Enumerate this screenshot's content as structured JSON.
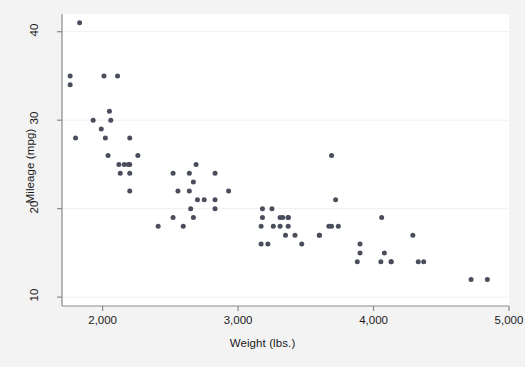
{
  "chart_data": {
    "type": "scatter",
    "title": "",
    "subtitle": "",
    "xlabel": "Weight (lbs.)",
    "ylabel": "Mileage (mpg)",
    "xlim": [
      1700,
      5000
    ],
    "ylim": [
      9,
      42
    ],
    "xticks": [
      2000,
      3000,
      4000,
      5000
    ],
    "xticklabels": [
      "2,000",
      "3,000",
      "4,000",
      "5,000"
    ],
    "yticks": [
      10,
      20,
      30,
      40
    ],
    "yticklabels": [
      "10",
      "20",
      "30",
      "40"
    ],
    "grid": "horizontal",
    "legend": "none",
    "marker_color": "#4a4e5c",
    "marker_size": 5,
    "background_color": "#f3f3f3",
    "panel_color": "#ffffff",
    "gridline_color": "#f0f0f2",
    "axis_color": "#8a8a8a",
    "series": [
      {
        "name": "auto",
        "x": [
          2930,
          3350,
          2640,
          3250,
          4080,
          3670,
          3690,
          3180,
          3220,
          4060,
          3600,
          3330,
          3370,
          4130,
          4370,
          4054,
          3720,
          3370,
          4130,
          2830,
          3370,
          2020,
          2130,
          2190,
          2410,
          2200,
          2670,
          2595,
          2700,
          2556,
          2200,
          3310,
          2750,
          3470,
          2830,
          2200,
          2520,
          2520,
          3310,
          3740,
          2260,
          3690,
          3180,
          3170,
          3260,
          3600,
          2640,
          2830,
          2690,
          4720,
          3420,
          3880,
          3900,
          4330,
          3900,
          4290,
          2110,
          2200,
          2670,
          2650,
          2060,
          2010,
          1800,
          1760,
          2050,
          1830,
          2120,
          1760,
          2160,
          2040,
          1930,
          1990,
          3170,
          4840
        ],
        "y": [
          22,
          17,
          22,
          20,
          15,
          18,
          26,
          20,
          16,
          19,
          17,
          19,
          18,
          14,
          14,
          14,
          21,
          19,
          14,
          21,
          19,
          28,
          24,
          25,
          18,
          25,
          19,
          18,
          21,
          22,
          22,
          19,
          21,
          16,
          24,
          24,
          24,
          19,
          18,
          18,
          26,
          18,
          19,
          18,
          18,
          17,
          24,
          20,
          25,
          12,
          17,
          14,
          15,
          14,
          16,
          17,
          35,
          28,
          23,
          20,
          30,
          35,
          28,
          35,
          31,
          41,
          25,
          34,
          25,
          26,
          30,
          29,
          16,
          12
        ]
      }
    ]
  },
  "axes": {
    "x_title": "Weight (lbs.)",
    "y_title": "Mileage (mpg)",
    "x_tick_labels": [
      "2,000",
      "3,000",
      "4,000",
      "5,000"
    ],
    "y_tick_labels": [
      "10",
      "20",
      "30",
      "40"
    ]
  }
}
